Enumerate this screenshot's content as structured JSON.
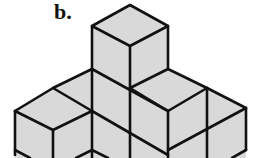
{
  "figure": {
    "label": "b.",
    "face_color": "#d9d9d9",
    "edge_color": "#111111"
  }
}
